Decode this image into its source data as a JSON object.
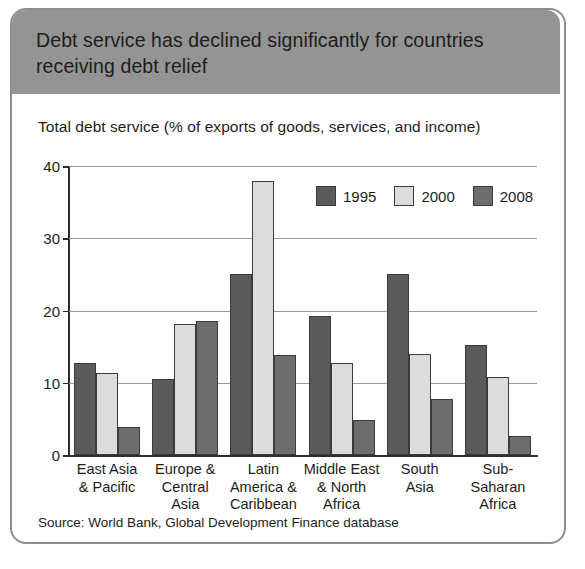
{
  "figure": {
    "title": "Debt service has declined significantly for countries receiving debt relief",
    "subtitle": "Total debt service (% of exports of goods, services, and income)",
    "source": "Source: World Bank, Global Development Finance database",
    "header_color": "#949494",
    "frame_color": "#8d8d8d"
  },
  "chart_data": {
    "type": "bar",
    "title": "Debt service has declined significantly for countries receiving debt relief",
    "subtitle": "Total debt service (% of exports of goods, services, and income)",
    "xlabel": "",
    "ylabel": "Total debt service (% of exports of goods, services, and income)",
    "ylim": [
      0,
      40
    ],
    "yticks": [
      0,
      10,
      20,
      30,
      40
    ],
    "ytick_labels": [
      "0",
      "10",
      "20",
      "30",
      "40"
    ],
    "grid": true,
    "grid_axis": "y",
    "legend_position": "upper center",
    "categories": [
      "East Asia\n& Pacific",
      "Europe &\nCentral\nAsia",
      "Latin\nAmerica &\nCaribbean",
      "Middle East\n& North\nAfrica",
      "South\nAsia",
      "Sub-\nSaharan\nAfrica"
    ],
    "series": [
      {
        "name": "1995",
        "color": "#5a5a5a",
        "values": [
          12.8,
          10.5,
          25.0,
          19.3,
          25.0,
          15.2
        ]
      },
      {
        "name": "2000",
        "color": "#dcdcdc",
        "values": [
          11.4,
          18.1,
          37.9,
          12.8,
          14.0,
          10.8
        ]
      },
      {
        "name": "2008",
        "color": "#6d6d6d",
        "values": [
          3.9,
          18.5,
          13.8,
          4.8,
          7.8,
          2.6
        ]
      }
    ]
  }
}
